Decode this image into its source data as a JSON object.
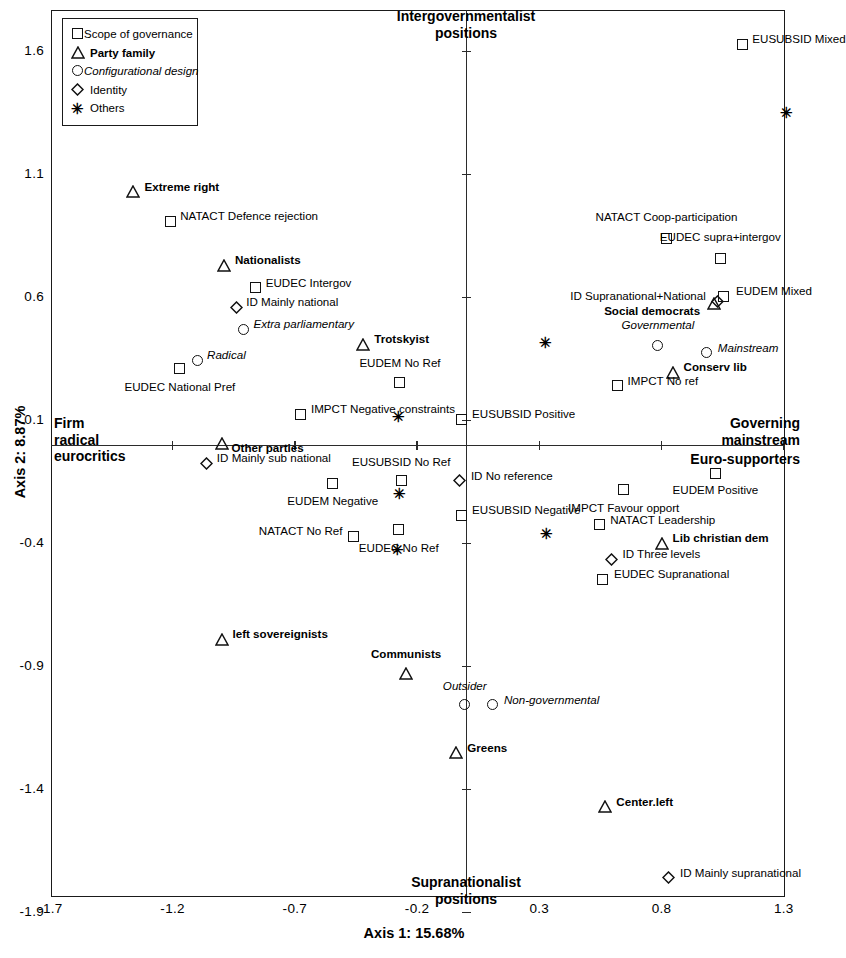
{
  "chart_data": {
    "type": "scatter",
    "title": "",
    "xlabel": "Axis 1: 15.68%",
    "ylabel": "Axis 2: 8.87%",
    "xlim": [
      -1.7,
      1.45
    ],
    "ylim": [
      -1.9,
      1.75
    ],
    "xticks": [
      "-1.7",
      "-1.2",
      "-0.7",
      "-0.2",
      "0.3",
      "0.8",
      "1.3"
    ],
    "xtick_values": [
      -1.7,
      -1.2,
      -0.7,
      -0.2,
      0.3,
      0.8,
      1.3
    ],
    "yticks": [
      "1.6",
      "1.1",
      "0.6",
      "0.1",
      "-0.4",
      "-0.9",
      "-1.4",
      "-1.9"
    ],
    "ytick_values": [
      1.6,
      1.1,
      0.6,
      0.1,
      -0.4,
      -0.9,
      -1.4,
      -1.9
    ],
    "grid": false,
    "legend_position": "top-left",
    "pole_labels": {
      "top": "Intergovernmentalist\npositions",
      "bottom": "Supranationalist\npositions",
      "left": "Firm\nradical\neurocritics",
      "right": "Governing\nmainstream",
      "right_secondary": "Euro-supporters"
    },
    "legend": [
      {
        "marker": "square",
        "label": "Scope of governance",
        "style": "normal"
      },
      {
        "marker": "triangle",
        "label": "Party family",
        "style": "bold"
      },
      {
        "marker": "circle",
        "label": "Configurational design",
        "style": "italic"
      },
      {
        "marker": "diamond",
        "label": "Identity",
        "style": "normal"
      },
      {
        "marker": "asterisk",
        "label": "Others",
        "style": "normal"
      }
    ],
    "points": [
      {
        "label": "EUSUBSID Mixed",
        "marker": "square",
        "style": "normal",
        "x": 1.13,
        "y": 1.63,
        "lx": 10,
        "ly": -6,
        "anchor": "left"
      },
      {
        "label": "",
        "marker": "asterisk",
        "style": "normal",
        "x": 1.31,
        "y": 1.35,
        "lx": 0,
        "ly": 0,
        "anchor": "left"
      },
      {
        "label": "Extreme right",
        "marker": "triangle",
        "style": "bold",
        "x": -1.36,
        "y": 1.03,
        "lx": 11,
        "ly": -6,
        "anchor": "left"
      },
      {
        "label": "NATACT Defence rejection",
        "marker": "square",
        "style": "normal",
        "x": -1.21,
        "y": 0.91,
        "lx": 10,
        "ly": -6,
        "anchor": "left"
      },
      {
        "label": "NATACT Coop-participation",
        "marker": "square",
        "style": "normal",
        "x": 0.82,
        "y": 0.84,
        "lx": 0,
        "ly": -22,
        "anchor": "center"
      },
      {
        "label": "EUDEC supra+intergov",
        "marker": "square",
        "style": "normal",
        "x": 1.04,
        "y": 0.76,
        "lx": 0,
        "ly": -22,
        "anchor": "center"
      },
      {
        "label": "Nationalists",
        "marker": "triangle",
        "style": "bold",
        "x": -0.99,
        "y": 0.73,
        "lx": 11,
        "ly": -6,
        "anchor": "left"
      },
      {
        "label": "EUDEC Intergov",
        "marker": "square",
        "style": "normal",
        "x": -0.86,
        "y": 0.64,
        "lx": 10,
        "ly": -6,
        "anchor": "left"
      },
      {
        "label": "EUDEM Mixed",
        "marker": "square",
        "style": "normal",
        "x": 1.055,
        "y": 0.605,
        "lx": 12,
        "ly": -6,
        "anchor": "left"
      },
      {
        "label": "ID Supranational+National",
        "marker": "diamond",
        "style": "normal",
        "x": 1.03,
        "y": 0.585,
        "lx": -12,
        "ly": -6,
        "anchor": "right"
      },
      {
        "label": "Social democrats",
        "marker": "triangle",
        "style": "bold",
        "x": 1.015,
        "y": 0.575,
        "lx": -14,
        "ly": 6,
        "anchor": "right"
      },
      {
        "label": "ID Mainly national",
        "marker": "diamond",
        "style": "normal",
        "x": -0.94,
        "y": 0.56,
        "lx": 10,
        "ly": -6,
        "anchor": "left"
      },
      {
        "label": "Extra parliamentary",
        "marker": "circle",
        "style": "italic",
        "x": -0.91,
        "y": 0.47,
        "lx": 10,
        "ly": -6,
        "anchor": "left"
      },
      {
        "label": "Governmental",
        "marker": "circle",
        "style": "italic",
        "x": 0.785,
        "y": 0.405,
        "lx": 0,
        "ly": -21,
        "anchor": "center"
      },
      {
        "label": "Mainstream",
        "marker": "circle",
        "style": "italic",
        "x": 0.985,
        "y": 0.375,
        "lx": 11,
        "ly": -6,
        "anchor": "left"
      },
      {
        "label": "Trotskyist",
        "marker": "triangle",
        "style": "bold",
        "x": -0.42,
        "y": 0.41,
        "lx": 11,
        "ly": -6,
        "anchor": "left"
      },
      {
        "label": "",
        "marker": "asterisk",
        "style": "normal",
        "x": 0.325,
        "y": 0.415,
        "lx": 0,
        "ly": 0,
        "anchor": "left"
      },
      {
        "label": "Radical",
        "marker": "circle",
        "style": "italic",
        "x": -1.1,
        "y": 0.345,
        "lx": 10,
        "ly": -6,
        "anchor": "left"
      },
      {
        "label": "EUDEC National Pref",
        "marker": "square",
        "style": "normal",
        "x": -1.17,
        "y": 0.31,
        "lx": 0,
        "ly": 17,
        "anchor": "center"
      },
      {
        "label": "Conserv lib",
        "marker": "triangle",
        "style": "bold",
        "x": 0.845,
        "y": 0.295,
        "lx": 11,
        "ly": -6,
        "anchor": "left"
      },
      {
        "label": "EUDEM No Ref",
        "marker": "square",
        "style": "normal",
        "x": -0.27,
        "y": 0.255,
        "lx": 0,
        "ly": -20,
        "anchor": "center"
      },
      {
        "label": "IMPCT No ref",
        "marker": "square",
        "style": "normal",
        "x": 0.62,
        "y": 0.24,
        "lx": 10,
        "ly": -6,
        "anchor": "left"
      },
      {
        "label": "IMPCT Negative constraints",
        "marker": "square",
        "style": "normal",
        "x": -0.675,
        "y": 0.125,
        "lx": 10,
        "ly": -6,
        "anchor": "left"
      },
      {
        "label": "",
        "marker": "asterisk",
        "style": "normal",
        "x": -0.275,
        "y": 0.115,
        "lx": 0,
        "ly": 0,
        "anchor": "left"
      },
      {
        "label": "EUSUBSID Positive",
        "marker": "square",
        "style": "normal",
        "x": -0.02,
        "y": 0.105,
        "lx": 11,
        "ly": -6,
        "anchor": "left"
      },
      {
        "label": "Other parties",
        "marker": "triangle",
        "style": "bold",
        "x": -1.0,
        "y": 0.005,
        "lx": 10,
        "ly": 3,
        "anchor": "left"
      },
      {
        "label": "ID Mainly sub national",
        "marker": "diamond",
        "style": "normal",
        "x": -1.06,
        "y": -0.075,
        "lx": 10,
        "ly": -6,
        "anchor": "left"
      },
      {
        "label": "EUSUBSID No Ref",
        "marker": "square",
        "style": "normal",
        "x": -0.265,
        "y": -0.145,
        "lx": 0,
        "ly": -20,
        "anchor": "center"
      },
      {
        "label": "ID No reference",
        "marker": "diamond",
        "style": "normal",
        "x": -0.025,
        "y": -0.145,
        "lx": 11,
        "ly": -6,
        "anchor": "left"
      },
      {
        "label": "EUDEM Positive",
        "marker": "square",
        "style": "normal",
        "x": 1.02,
        "y": -0.115,
        "lx": 0,
        "ly": 16,
        "anchor": "center"
      },
      {
        "label": "EUDEM Negative",
        "marker": "square",
        "style": "normal",
        "x": -0.545,
        "y": -0.155,
        "lx": 0,
        "ly": 17,
        "anchor": "center"
      },
      {
        "label": "IMPCT Favour opport",
        "marker": "square",
        "style": "normal",
        "x": 0.645,
        "y": -0.18,
        "lx": 0,
        "ly": 18,
        "anchor": "center"
      },
      {
        "label": "",
        "marker": "asterisk",
        "style": "normal",
        "x": -0.27,
        "y": -0.2,
        "lx": 0,
        "ly": 0,
        "anchor": "left"
      },
      {
        "label": "EUSUBSID Negative",
        "marker": "square",
        "style": "normal",
        "x": -0.02,
        "y": -0.285,
        "lx": 11,
        "ly": -6,
        "anchor": "left"
      },
      {
        "label": "NATACT Leadership",
        "marker": "square",
        "style": "normal",
        "x": 0.545,
        "y": -0.325,
        "lx": 11,
        "ly": -6,
        "anchor": "left"
      },
      {
        "label": "",
        "marker": "asterisk",
        "style": "normal",
        "x": 0.33,
        "y": -0.36,
        "lx": 0,
        "ly": 0,
        "anchor": "left"
      },
      {
        "label": "NATACT No Ref",
        "marker": "square",
        "style": "normal",
        "x": -0.46,
        "y": -0.37,
        "lx": -11,
        "ly": -6,
        "anchor": "right"
      },
      {
        "label": "EUDEC No Ref",
        "marker": "square",
        "style": "normal",
        "x": -0.275,
        "y": -0.345,
        "lx": 0,
        "ly": 17,
        "anchor": "center"
      },
      {
        "label": "Lib christian dem",
        "marker": "triangle",
        "style": "bold",
        "x": 0.8,
        "y": -0.4,
        "lx": 11,
        "ly": -6,
        "anchor": "left"
      },
      {
        "label": "",
        "marker": "asterisk",
        "style": "normal",
        "x": -0.28,
        "y": -0.425,
        "lx": 0,
        "ly": 0,
        "anchor": "left"
      },
      {
        "label": "ID Three levels",
        "marker": "diamond",
        "style": "normal",
        "x": 0.595,
        "y": -0.465,
        "lx": 11,
        "ly": -6,
        "anchor": "left"
      },
      {
        "label": "EUDEC Supranational",
        "marker": "square",
        "style": "normal",
        "x": 0.56,
        "y": -0.545,
        "lx": 11,
        "ly": -6,
        "anchor": "left"
      },
      {
        "label": "left sovereignists",
        "marker": "triangle",
        "style": "bold",
        "x": -1.0,
        "y": -0.79,
        "lx": 11,
        "ly": -6,
        "anchor": "left"
      },
      {
        "label": "Communists",
        "marker": "triangle",
        "style": "bold",
        "x": -0.245,
        "y": -0.93,
        "lx": 0,
        "ly": -21,
        "anchor": "center"
      },
      {
        "label": "Outsider",
        "marker": "circle",
        "style": "italic",
        "x": -0.005,
        "y": -1.055,
        "lx": 0,
        "ly": -20,
        "anchor": "center"
      },
      {
        "label": "Non-governmental",
        "marker": "circle",
        "style": "italic",
        "x": 0.11,
        "y": -1.055,
        "lx": 11,
        "ly": -6,
        "anchor": "left"
      },
      {
        "label": "Greens",
        "marker": "triangle",
        "style": "bold",
        "x": -0.04,
        "y": -1.25,
        "lx": 11,
        "ly": -6,
        "anchor": "left"
      },
      {
        "label": "Center.left",
        "marker": "triangle",
        "style": "bold",
        "x": 0.57,
        "y": -1.47,
        "lx": 11,
        "ly": -6,
        "anchor": "left"
      },
      {
        "label": "ID Mainly supranational",
        "marker": "diamond",
        "style": "normal",
        "x": 0.83,
        "y": -1.76,
        "lx": 11,
        "ly": -6,
        "anchor": "left"
      }
    ]
  }
}
